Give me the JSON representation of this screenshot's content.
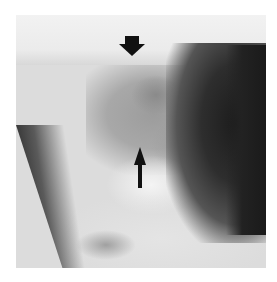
{
  "image": {
    "description": "Lateral cervical spine radiograph with two black arrow markers",
    "markers": [
      {
        "type": "arrowhead-down",
        "label": "upper arrowhead marker"
      },
      {
        "type": "arrow-up",
        "label": "lower arrow marker"
      }
    ],
    "colors": {
      "background": "#ffffff",
      "marker": "#111111"
    }
  }
}
